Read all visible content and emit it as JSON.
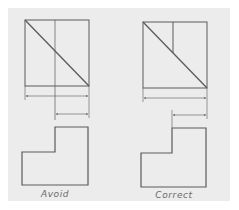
{
  "figure": {
    "background_color": "#ececec",
    "line_color": "#4a4a4a",
    "caption_color": "#6a6a6a"
  },
  "examples": [
    {
      "id": "avoid",
      "caption": "Avoid",
      "description": "Dimension placed with extension line taken from a hidden/incorrect view location"
    },
    {
      "id": "correct",
      "caption": "Correct",
      "description": "Dimension placed between views with extension lines from the true edge in the profile view"
    }
  ]
}
